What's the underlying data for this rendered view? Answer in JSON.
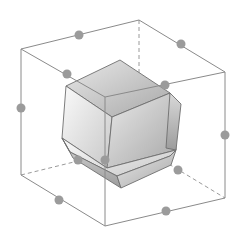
{
  "figure": {
    "colors": {
      "background": "#ffffff",
      "edge": "#8a8a8a",
      "hidden_edge": "#9a9a9a",
      "dot": "#9b9b9b",
      "face_light": "#f4f4f4",
      "face_mid": "#d2d2d2",
      "face_dark": "#a9a9a9",
      "face_edge": "#6e6e6e"
    },
    "cube": {
      "vertices": {
        "top_left": [
          21,
          49
        ],
        "top_back": [
          139,
          20
        ],
        "top_right": [
          225,
          72
        ],
        "top_front": [
          105,
          97
        ],
        "bottom_left": [
          21,
          175
        ],
        "bottom_back": [
          139,
          146
        ],
        "bottom_right": [
          225,
          198
        ],
        "bottom_front": [
          105,
          226
        ]
      },
      "visible_edges": [
        [
          "top_left",
          "top_back"
        ],
        [
          "top_back",
          "top_right"
        ],
        [
          "top_left",
          "top_front"
        ],
        [
          "top_front",
          "top_right"
        ],
        [
          "top_left",
          "bottom_left"
        ],
        [
          "top_right",
          "bottom_right"
        ],
        [
          "top_front",
          "bottom_front"
        ],
        [
          "bottom_left",
          "bottom_front"
        ],
        [
          "bottom_front",
          "bottom_right"
        ]
      ],
      "hidden_edges": [
        [
          "top_back",
          "bottom_back"
        ],
        [
          "bottom_left",
          "bottom_back"
        ],
        [
          "bottom_back",
          "bottom_right"
        ]
      ]
    },
    "edge_midpoints": [
      [
        79,
        35
      ],
      [
        181,
        44
      ],
      [
        67,
        74
      ],
      [
        165,
        85
      ],
      [
        21,
        108
      ],
      [
        225,
        135
      ],
      [
        105,
        160
      ],
      [
        78,
        160
      ],
      [
        178,
        170
      ],
      [
        59,
        200
      ],
      [
        166,
        211
      ]
    ],
    "polyhedron": {
      "faces": [
        {
          "name": "top-back-face",
          "points": [
            [
              66,
              86
            ],
            [
              120,
              60
            ],
            [
              170,
              93
            ],
            [
              112,
              117
            ]
          ],
          "shade": "face_mid"
        },
        {
          "name": "top-left-face",
          "points": [
            [
              66,
              86
            ],
            [
              112,
              117
            ],
            [
              107,
              168
            ],
            [
              62,
              138
            ]
          ],
          "shade": "face_light"
        },
        {
          "name": "top-right-face",
          "points": [
            [
              112,
              117
            ],
            [
              170,
              93
            ],
            [
              176,
              150
            ],
            [
              107,
              168
            ]
          ],
          "shade": "face_mid"
        },
        {
          "name": "bottom-face",
          "points": [
            [
              62,
              138
            ],
            [
              107,
              168
            ],
            [
              176,
              150
            ],
            [
              170,
              156
            ],
            [
              117,
              176
            ],
            [
              70,
              152
            ]
          ],
          "shade": "face_light"
        },
        {
          "name": "right-bevel",
          "points": [
            [
              170,
              93
            ],
            [
              181,
              104
            ],
            [
              176,
              150
            ],
            [
              166,
              148
            ]
          ],
          "shade": "face_dark"
        },
        {
          "name": "bottom-bevel",
          "points": [
            [
              62,
              138
            ],
            [
              70,
              152
            ],
            [
              117,
              176
            ],
            [
              121,
              188
            ],
            [
              73,
              158
            ]
          ],
          "shade": "face_dark"
        },
        {
          "name": "front-bevel",
          "points": [
            [
              117,
              176
            ],
            [
              170,
              156
            ],
            [
              176,
              150
            ],
            [
              171,
              165
            ],
            [
              121,
              188
            ]
          ],
          "shade": "face_mid"
        }
      ]
    }
  }
}
